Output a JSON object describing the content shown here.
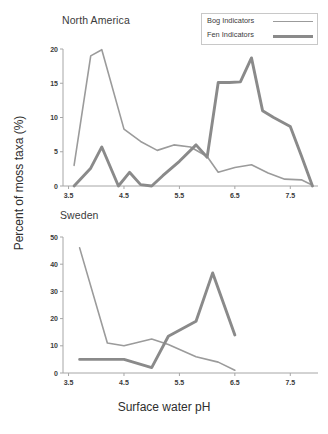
{
  "figure": {
    "xlabel": "Surface water pH",
    "ylabel": "Percent of moss taxa (%)"
  },
  "legend": {
    "bog_label": "Bog Indicators",
    "fen_label": "Fen Indicators",
    "bog_color": "#9b9b9b",
    "fen_color": "#8a8a8a",
    "position": "top-right"
  },
  "chart_data": [
    {
      "type": "line",
      "title": "North America",
      "xlabel": "Surface water pH",
      "ylabel": "Percent of moss taxa (%)",
      "xlim": [
        3.4,
        8.0
      ],
      "ylim": [
        0,
        20
      ],
      "xticks": [
        3.5,
        4.5,
        5.5,
        6.5,
        7.5
      ],
      "yticks": [
        0,
        5,
        10,
        15,
        20
      ],
      "grid": false,
      "series": [
        {
          "name": "Bog Indicators",
          "x": [
            3.6,
            3.9,
            4.1,
            4.5,
            4.8,
            5.1,
            5.4,
            5.7,
            6.0,
            6.2,
            6.5,
            6.8,
            7.1,
            7.4,
            7.7,
            7.9
          ],
          "values": [
            3.0,
            19.0,
            19.9,
            8.3,
            6.5,
            5.2,
            6.0,
            5.7,
            4.3,
            2.0,
            2.7,
            3.1,
            1.9,
            1.0,
            0.9,
            0.1
          ]
        },
        {
          "name": "Fen Indicators",
          "x": [
            3.6,
            3.9,
            4.1,
            4.4,
            4.6,
            4.8,
            5.0,
            5.2,
            5.5,
            5.8,
            6.0,
            6.2,
            6.4,
            6.6,
            6.8,
            7.0,
            7.2,
            7.5,
            7.7,
            7.9
          ],
          "values": [
            0.0,
            2.6,
            5.7,
            0.0,
            2.0,
            0.2,
            0.0,
            1.5,
            3.6,
            6.0,
            4.2,
            15.1,
            15.1,
            15.2,
            18.7,
            11.0,
            10.0,
            8.7,
            4.4,
            0.0
          ]
        }
      ]
    },
    {
      "type": "line",
      "title": "Sweden",
      "xlabel": "Surface water pH",
      "ylabel": "Percent of moss taxa (%)",
      "xlim": [
        3.4,
        8.0
      ],
      "ylim": [
        0,
        50
      ],
      "xticks": [
        3.5,
        4.5,
        5.5,
        6.5,
        7.5
      ],
      "yticks": [
        0,
        10,
        20,
        30,
        40,
        50
      ],
      "grid": false,
      "series": [
        {
          "name": "Bog Indicators",
          "x": [
            3.7,
            4.2,
            4.5,
            5.0,
            5.3,
            5.8,
            6.2,
            6.5
          ],
          "values": [
            46.0,
            11.0,
            10.0,
            12.5,
            10.5,
            6.0,
            4.0,
            1.0
          ]
        },
        {
          "name": "Fen Indicators",
          "x": [
            3.7,
            4.5,
            5.0,
            5.3,
            5.8,
            6.1,
            6.5
          ],
          "values": [
            5.0,
            5.0,
            2.0,
            13.5,
            19.0,
            36.8,
            14.0
          ]
        }
      ]
    }
  ]
}
